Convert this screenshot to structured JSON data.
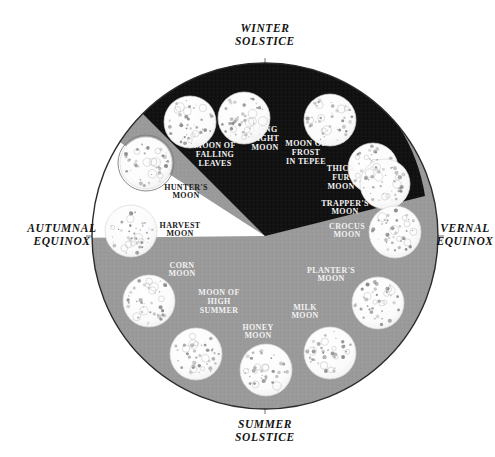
{
  "figure": {
    "background_color": "#ffffff",
    "outline_color": "#2b2b2b",
    "winter_wedge_color": "#111111",
    "gray_field_color": "#9a9a9a",
    "white_wedge_color": "#ffffff",
    "moon_fill_color": "#fafafa",
    "light_text_color": "#f2f2f2",
    "dark_text_color": "#1a1a1a",
    "center_x": 265,
    "center_y": 236,
    "radius": 173
  },
  "season_markers": [
    {
      "id": "winter-solstice",
      "line1": "WINTER",
      "line2": "SOLSTICE",
      "x": 265,
      "y": 32,
      "anchor": "middle"
    },
    {
      "id": "summer-solstice",
      "line1": "SUMMER",
      "line2": "SOLSTICE",
      "x": 265,
      "y": 428,
      "anchor": "middle"
    },
    {
      "id": "autumnal-equinox",
      "line1": "AUTUMNAL",
      "line2": "EQUINOX",
      "x": 62,
      "y": 232,
      "anchor": "middle"
    },
    {
      "id": "vernal-equinox",
      "line1": "VERNAL",
      "line2": "EQUINOX",
      "x": 465,
      "y": 232,
      "anchor": "middle"
    }
  ],
  "moons": [
    {
      "id": "long-night-moon",
      "label": [
        "LONG",
        "NIGHT",
        "MOON"
      ],
      "moon_x": 244,
      "moon_y": 118,
      "moon_r": 26,
      "label_x": 265,
      "label_y": 141,
      "tone": "light",
      "region": "winter"
    },
    {
      "id": "moon-of-frost-in-tepee",
      "label": [
        "MOON OF",
        "FROST",
        "IN TEPEE"
      ],
      "moon_x": 330,
      "moon_y": 120,
      "moon_r": 26,
      "label_x": 306,
      "label_y": 155,
      "tone": "light",
      "region": "winter"
    },
    {
      "id": "thick-fur-moon",
      "label": [
        "THICK",
        "FUR",
        "MOON"
      ],
      "moon_x": 373,
      "moon_y": 168,
      "moon_r": 25,
      "label_x": 341,
      "label_y": 180,
      "tone": "light",
      "region": "winter"
    },
    {
      "id": "trappers-moon",
      "label": [
        "TRAPPER'S",
        "MOON"
      ],
      "moon_x": 385,
      "moon_y": 184,
      "moon_r": 25,
      "label_x": 345,
      "label_y": 210,
      "tone": "light",
      "region": "winter"
    },
    {
      "id": "crocus-moon",
      "label": [
        "CROCUS",
        "MOON"
      ],
      "moon_x": 395,
      "moon_y": 232,
      "moon_r": 26,
      "label_x": 347,
      "label_y": 233,
      "tone": "light",
      "region": "spring"
    },
    {
      "id": "planters-moon",
      "label": [
        "PLANTER'S",
        "MOON"
      ],
      "moon_x": 378,
      "moon_y": 303,
      "moon_r": 26,
      "label_x": 331,
      "label_y": 277,
      "tone": "light",
      "region": "spring"
    },
    {
      "id": "milk-moon",
      "label": [
        "MILK",
        "MOON"
      ],
      "moon_x": 330,
      "moon_y": 353,
      "moon_r": 26,
      "label_x": 305,
      "label_y": 314,
      "tone": "light",
      "region": "spring"
    },
    {
      "id": "honey-moon",
      "label": [
        "HONEY",
        "MOON"
      ],
      "moon_x": 266,
      "moon_y": 370,
      "moon_r": 26,
      "label_x": 258,
      "label_y": 334,
      "tone": "light",
      "region": "summer"
    },
    {
      "id": "moon-of-high-summer",
      "label": [
        "MOON OF",
        "HIGH",
        "SUMMER"
      ],
      "moon_x": 196,
      "moon_y": 354,
      "moon_r": 26,
      "label_x": 219,
      "label_y": 304,
      "tone": "light",
      "region": "summer"
    },
    {
      "id": "corn-moon",
      "label": [
        "CORN",
        "MOON"
      ],
      "moon_x": 149,
      "moon_y": 301,
      "moon_r": 26,
      "label_x": 182,
      "label_y": 272,
      "tone": "light",
      "region": "summer"
    },
    {
      "id": "harvest-moon",
      "label": [
        "HARVEST",
        "MOON"
      ],
      "moon_x": 131,
      "moon_y": 231,
      "moon_r": 26,
      "label_x": 180,
      "label_y": 232,
      "tone": "dark",
      "region": "autumn"
    },
    {
      "id": "hunters-moon",
      "label": [
        "HUNTER'S",
        "MOON"
      ],
      "moon_x": 146,
      "moon_y": 163,
      "moon_r": 26,
      "label_x": 186,
      "label_y": 194,
      "tone": "dark",
      "region": "autumn-extra"
    },
    {
      "id": "moon-of-falling-leaves",
      "label": [
        "MOON OF",
        "FALLING",
        "LEAVES"
      ],
      "moon_x": 190,
      "moon_y": 122,
      "moon_r": 26,
      "label_x": 215,
      "label_y": 157,
      "tone": "light",
      "region": "winter"
    }
  ],
  "regions": {
    "winter_wedge": {
      "name": "winter-dark-wedge",
      "start_angle_deg": 137,
      "end_angle_deg": 22
    },
    "white_wedge": {
      "name": "hunters-moon-white-wedge",
      "start_angle_deg": 155,
      "end_angle_deg": 126
    }
  }
}
